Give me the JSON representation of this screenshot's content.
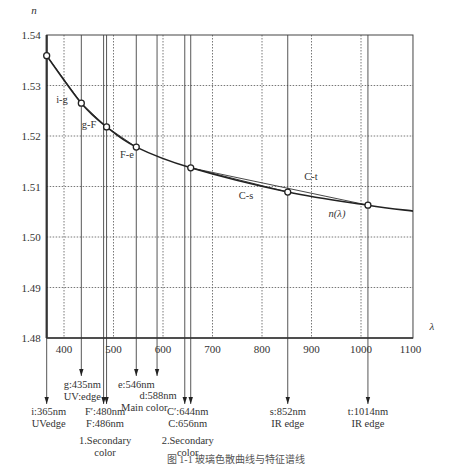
{
  "chart_data": {
    "type": "line",
    "title": "",
    "xlabel": "λ",
    "ylabel": "n",
    "xlim": [
      365,
      1105
    ],
    "ylim": [
      1.48,
      1.54
    ],
    "grid": true,
    "x_ticks": [
      400,
      500,
      600,
      700,
      800,
      900,
      1000,
      1100
    ],
    "x_tick_labels": [
      "400",
      "500",
      "600",
      "700",
      "800",
      "900",
      "1000",
      "1100"
    ],
    "y_ticks": [
      1.48,
      1.49,
      1.5,
      1.51,
      1.52,
      1.53,
      1.54
    ],
    "y_tick_labels": [
      "1.48",
      "1.49",
      "1.50",
      "1.51",
      "1.52",
      "1.53",
      "1.54"
    ],
    "curve_label": "n(λ)",
    "points": [
      {
        "id": "i",
        "x": 365,
        "y": 1.5359
      },
      {
        "id": "g",
        "x": 435,
        "y": 1.5265
      },
      {
        "id": "F",
        "x": 486,
        "y": 1.5218
      },
      {
        "id": "e",
        "x": 546,
        "y": 1.5178
      },
      {
        "id": "C",
        "x": 656,
        "y": 1.5137
      },
      {
        "id": "s",
        "x": 852,
        "y": 1.5089
      },
      {
        "id": "t",
        "x": 1014,
        "y": 1.5063
      }
    ],
    "chords": [
      {
        "from": "i",
        "to": "g",
        "label": "i-g"
      },
      {
        "from": "g",
        "to": "F",
        "label": "g-F"
      },
      {
        "from": "F",
        "to": "e",
        "label": "F-e"
      },
      {
        "from": "C",
        "to": "s",
        "label": "C-s"
      },
      {
        "from": "C",
        "to": "t",
        "label": "C-t"
      }
    ],
    "spectral_lines": [
      {
        "wavelength": 365,
        "lines": [
          "i:365nm",
          "UVedge"
        ],
        "level": 3
      },
      {
        "wavelength": 435,
        "lines": [
          "g:435nm",
          "UV:edge"
        ],
        "level": 1
      },
      {
        "wavelength": 480,
        "lines": [],
        "level": 3
      },
      {
        "wavelength": 486,
        "lines": [],
        "level": 3
      },
      {
        "wavelength": 546,
        "lines": [
          "e:546nm"
        ],
        "level": 1
      },
      {
        "wavelength": 588,
        "lines": [
          "d:588nm",
          "Main color"
        ],
        "level": 2
      },
      {
        "wavelength": 644,
        "lines": [],
        "level": 3
      },
      {
        "wavelength": 656,
        "lines": [],
        "level": 3
      },
      {
        "wavelength": 852,
        "lines": [
          "s:852nm",
          "IR edge"
        ],
        "level": 4
      },
      {
        "wavelength": 1014,
        "lines": [
          "t:1014nm",
          "IR edge"
        ],
        "level": 4
      }
    ],
    "group_annotations": [
      {
        "center": 483,
        "lines": [
          "F′:480nm",
          "F:486nm",
          "1.Secondary",
          "color"
        ]
      },
      {
        "center": 650,
        "lines": [
          "C′:644nm",
          "C:656nm",
          "2.Secondary",
          "color"
        ]
      }
    ],
    "caption": "图 1-1  玻璃色散曲线与特征谱线"
  }
}
